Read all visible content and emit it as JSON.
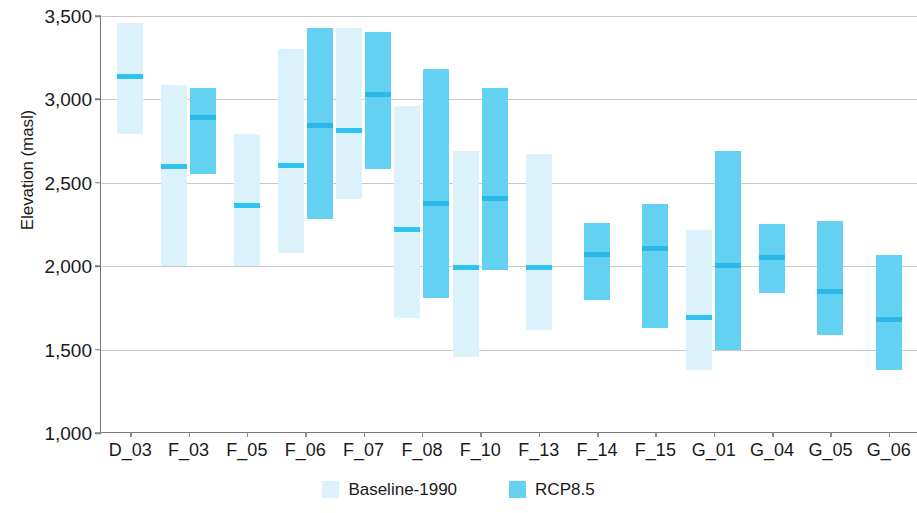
{
  "chart_data": {
    "type": "bar",
    "title": "",
    "subtitle": "",
    "xlabel": "",
    "ylabel": "Elevation (masl)",
    "ylim": [
      1000,
      3500
    ],
    "ytick_labels": [
      "3,500",
      "3,000",
      "2,500",
      "2,000",
      "1,500",
      "1,000"
    ],
    "ytick_values": [
      3500,
      3000,
      2500,
      2000,
      1500,
      1000
    ],
    "grid": true,
    "legend_position": "bottom-center",
    "categories": [
      "D_03",
      "F_03",
      "F_05",
      "F_06",
      "F_07",
      "F_08",
      "F_10",
      "F_13",
      "F_14",
      "F_15",
      "G_01",
      "G_04",
      "G_05",
      "G_06"
    ],
    "series": [
      {
        "name": "Baseline-1990",
        "color": "#dcf2fa",
        "median_color": "#2ec4ef",
        "ranges": [
          {
            "category": "D_03",
            "low": 2790,
            "high": 3460,
            "median": 3140
          },
          {
            "category": "F_03",
            "low": 2000,
            "high": 3085,
            "median": 2600
          },
          {
            "category": "F_05",
            "low": 2000,
            "high": 2795,
            "median": 2365
          },
          {
            "category": "F_06",
            "low": 2080,
            "high": 3300,
            "median": 2605
          },
          {
            "category": "F_07",
            "low": 2400,
            "high": 3430,
            "median": 2815
          },
          {
            "category": "F_08",
            "low": 1690,
            "high": 2960,
            "median": 2220
          },
          {
            "category": "F_10",
            "low": 1455,
            "high": 2690,
            "median": 1995
          },
          {
            "category": "F_13",
            "low": 1615,
            "high": 2670,
            "median": 1990
          },
          {
            "category": "F_14",
            "low": null,
            "high": null,
            "median": null
          },
          {
            "category": "F_15",
            "low": null,
            "high": null,
            "median": null
          },
          {
            "category": "G_01",
            "low": 1380,
            "high": 2220,
            "median": 1690
          },
          {
            "category": "G_04",
            "low": null,
            "high": null,
            "median": null
          },
          {
            "category": "G_05",
            "low": null,
            "high": null,
            "median": null
          },
          {
            "category": "G_06",
            "low": null,
            "high": null,
            "median": null
          }
        ]
      },
      {
        "name": "RCP8.5",
        "color": "#63d2f2",
        "median_color": "#2bb8e8",
        "ranges": [
          {
            "category": "D_03",
            "low": null,
            "high": null,
            "median": null
          },
          {
            "category": "F_03",
            "low": 2550,
            "high": 3070,
            "median": 2890
          },
          {
            "category": "F_05",
            "low": null,
            "high": null,
            "median": null
          },
          {
            "category": "F_06",
            "low": 2285,
            "high": 3430,
            "median": 2845
          },
          {
            "category": "F_07",
            "low": 2580,
            "high": 3405,
            "median": 3030
          },
          {
            "category": "F_08",
            "low": 1810,
            "high": 3185,
            "median": 2375
          },
          {
            "category": "F_10",
            "low": 1975,
            "high": 3070,
            "median": 2405
          },
          {
            "category": "F_13",
            "low": null,
            "high": null,
            "median": null
          },
          {
            "category": "F_14",
            "low": 1795,
            "high": 2260,
            "median": 2070
          },
          {
            "category": "F_15",
            "low": 1630,
            "high": 2370,
            "median": 2105
          },
          {
            "category": "G_01",
            "low": 1495,
            "high": 2690,
            "median": 2005
          },
          {
            "category": "G_04",
            "low": 1840,
            "high": 2255,
            "median": 2050
          },
          {
            "category": "G_05",
            "low": 1590,
            "high": 2270,
            "median": 1850
          },
          {
            "category": "G_06",
            "low": 1375,
            "high": 2065,
            "median": 1680
          }
        ]
      }
    ]
  },
  "legend": {
    "items": [
      {
        "label": "Baseline-1990",
        "key": "baseline"
      },
      {
        "label": "RCP8.5",
        "key": "rcp"
      }
    ]
  }
}
